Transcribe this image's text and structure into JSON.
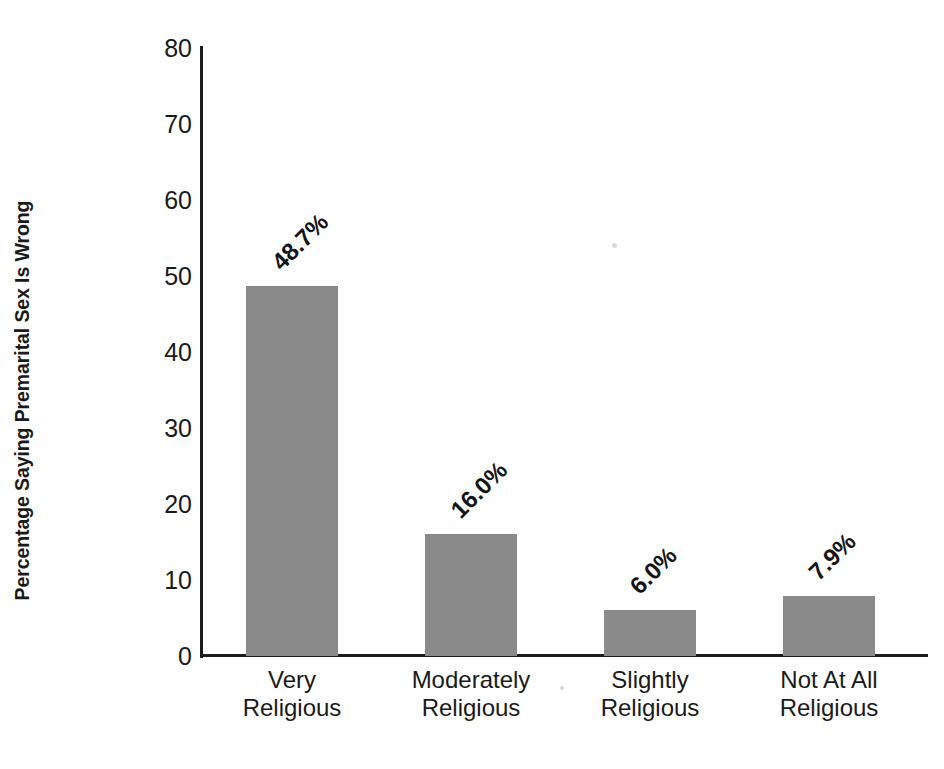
{
  "chart_data": {
    "type": "bar",
    "title": "",
    "xlabel": "",
    "ylabel": "Percentage Saying Premarital Sex Is Wrong",
    "ylim": [
      0,
      80
    ],
    "yticks": [
      0,
      10,
      20,
      30,
      40,
      50,
      60,
      70,
      80
    ],
    "ytick_labels": [
      "0",
      "10",
      "20",
      "30",
      "40",
      "50",
      "60",
      "70",
      "80"
    ],
    "grid": false,
    "legend": false,
    "bar_color": "#8a8a8a",
    "axis_color": "#1c1c1c",
    "categories": [
      "Very\nReligious",
      "Moderately\nReligious",
      "Slightly\nReligious",
      "Not At All\nReligious"
    ],
    "values": [
      48.7,
      16.0,
      6.0,
      7.9
    ],
    "value_labels": [
      "48.7%",
      "16.0%",
      "6.0%",
      "7.9%"
    ]
  }
}
